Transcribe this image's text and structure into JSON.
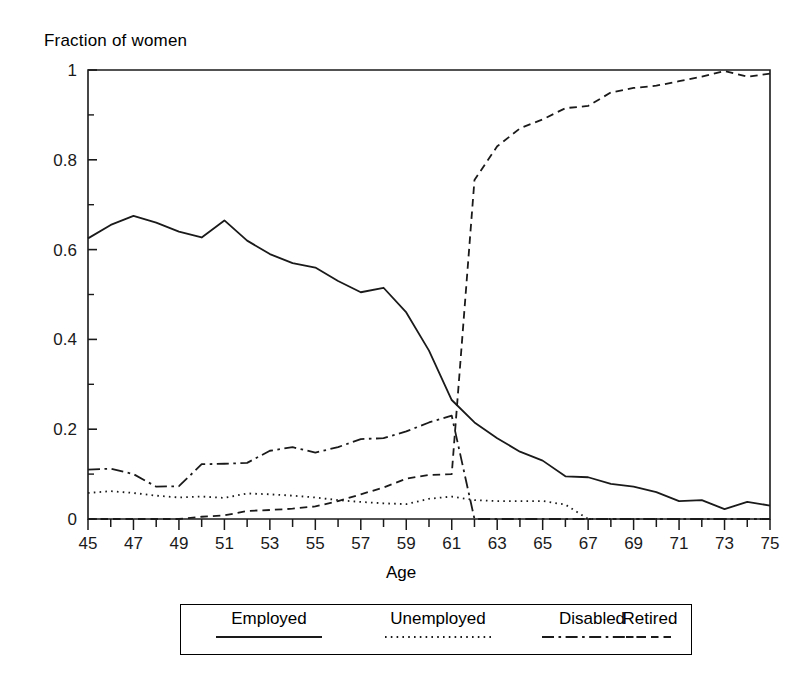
{
  "chart_data": {
    "type": "line",
    "title": "",
    "ylabel": "Fraction of women",
    "xlabel": "Age",
    "xlim": [
      45,
      75
    ],
    "ylim": [
      0,
      1
    ],
    "grid": false,
    "legend_position": "bottom",
    "x": [
      45,
      46,
      47,
      48,
      49,
      50,
      51,
      52,
      53,
      54,
      55,
      56,
      57,
      58,
      59,
      60,
      61,
      62,
      63,
      64,
      65,
      66,
      67,
      68,
      69,
      70,
      71,
      72,
      73,
      74,
      75
    ],
    "y_ticks": [
      0,
      0.2,
      0.4,
      0.6,
      0.8,
      1
    ],
    "y_tick_labels": [
      "0",
      "0.2",
      "0.4",
      "0.6",
      "0.8",
      "1"
    ],
    "y_minor_ticks": [
      0.1,
      0.3,
      0.5,
      0.7,
      0.9
    ],
    "x_ticks": [
      45,
      46,
      47,
      48,
      49,
      50,
      51,
      52,
      53,
      54,
      55,
      56,
      57,
      58,
      59,
      60,
      61,
      62,
      63,
      64,
      65,
      66,
      67,
      68,
      69,
      70,
      71,
      72,
      73,
      74,
      75
    ],
    "x_tick_labels": [
      "45",
      "",
      "47",
      "",
      "49",
      "",
      "51",
      "",
      "53",
      "",
      "55",
      "",
      "57",
      "",
      "59",
      "",
      "61",
      "",
      "63",
      "",
      "65",
      "",
      "67",
      "",
      "69",
      "",
      "71",
      "",
      "73",
      "",
      "75"
    ],
    "series": [
      {
        "name": "Employed",
        "style": "solid",
        "values": [
          0.625,
          0.655,
          0.675,
          0.66,
          0.64,
          0.627,
          0.665,
          0.62,
          0.59,
          0.57,
          0.56,
          0.53,
          0.505,
          0.515,
          0.46,
          0.375,
          0.265,
          0.215,
          0.18,
          0.15,
          0.13,
          0.095,
          0.093,
          0.078,
          0.072,
          0.06,
          0.04,
          0.042,
          0.022,
          0.038,
          0.03
        ]
      },
      {
        "name": "Unemployed",
        "style": "dotted",
        "values": [
          0.058,
          0.062,
          0.058,
          0.052,
          0.048,
          0.05,
          0.047,
          0.057,
          0.055,
          0.052,
          0.048,
          0.042,
          0.038,
          0.035,
          0.033,
          0.045,
          0.05,
          0.042,
          0.04,
          0.04,
          0.04,
          0.032,
          0.0,
          0.0,
          0.0,
          0.0,
          0.0,
          0.0,
          0.0,
          0.0,
          0.0
        ]
      },
      {
        "name": "Disabled",
        "style": "dashdot",
        "values": [
          0.11,
          0.112,
          0.1,
          0.072,
          0.073,
          0.122,
          0.123,
          0.125,
          0.152,
          0.16,
          0.148,
          0.16,
          0.178,
          0.18,
          0.195,
          0.215,
          0.23,
          0.0,
          0.0,
          0.0,
          0.0,
          0.0,
          0.0,
          0.0,
          0.0,
          0.0,
          0.0,
          0.0,
          0.0,
          0.0,
          0.0
        ]
      },
      {
        "name": "Retired",
        "style": "dashed",
        "values": [
          0.0,
          0.0,
          0.0,
          0.0,
          0.0,
          0.005,
          0.008,
          0.018,
          0.02,
          0.023,
          0.028,
          0.04,
          0.055,
          0.07,
          0.09,
          0.098,
          0.1,
          0.755,
          0.83,
          0.87,
          0.89,
          0.915,
          0.92,
          0.95,
          0.96,
          0.965,
          0.975,
          0.985,
          0.998,
          0.985,
          0.992
        ]
      }
    ],
    "series_notes": {
      "Employed": "solid line declining from ~0.63 at age 45 to ~0.02 at age 75",
      "Unemployed": "dotted line around 0.05, drops to 0 at age 60",
      "Disabled": "dash-dot line rising from 0.11 to peak 0.23 at age 59, drops to 0 at age 60",
      "Retired": "dashed line near 0 until age 50, rises to 0.10 at 59, jumps to 0.76 at age 60, approaches 1.0 by age 75"
    }
  },
  "axis": {
    "y_axis_title": "Fraction of women",
    "x_axis_title": "Age"
  },
  "legend": {
    "items": [
      {
        "label": "Employed",
        "style": "solid"
      },
      {
        "label": "Unemployed",
        "style": "dotted"
      },
      {
        "label": "Disabled",
        "style": "dashdot"
      },
      {
        "label": "Retired",
        "style": "dashed"
      }
    ]
  },
  "colors": {
    "line": "#1a1a1a",
    "axis": "#1a1a1a",
    "background": "#ffffff"
  }
}
